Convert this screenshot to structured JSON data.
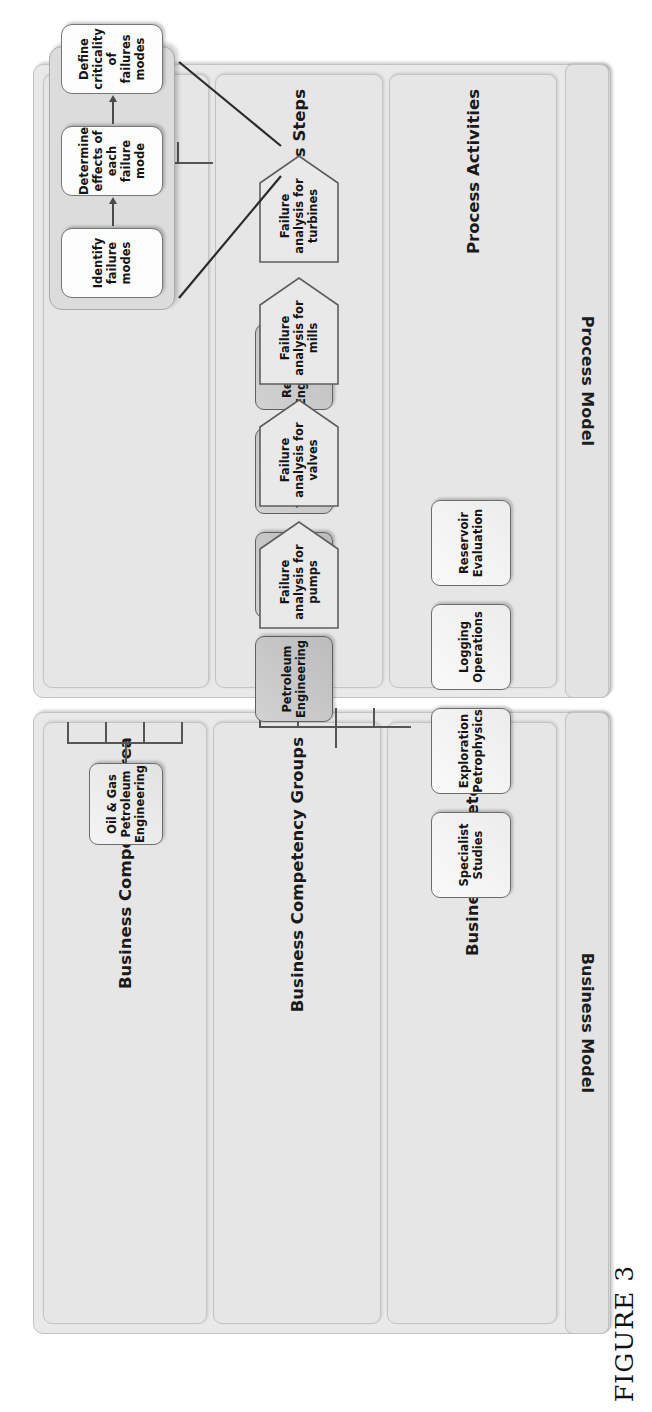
{
  "figure": {
    "caption": "FIGURE 3"
  },
  "sections": [
    {
      "id": "business-model",
      "title": "Business Model",
      "lanes": [
        {
          "id": "business-competency-area",
          "label": "Business Competency Area"
        },
        {
          "id": "business-competency-groups",
          "label": "Business Competency Groups"
        },
        {
          "id": "business-competencies",
          "label": "Business Competencies"
        }
      ]
    },
    {
      "id": "process-model",
      "title": "Process Model",
      "lanes": [
        {
          "id": "business-process",
          "label": "Business Process"
        },
        {
          "id": "process-steps",
          "label": "Process Steps"
        },
        {
          "id": "process-activities",
          "label": "Process Activities"
        }
      ]
    }
  ],
  "nodes": {
    "competency_area": [
      {
        "id": "oil-gas-petroleum-engineering",
        "label": "Oil & Gas Petroleum Engineering"
      }
    ],
    "competency_groups": [
      {
        "id": "petroleum-engineering",
        "label": "Petroleum Engineering"
      },
      {
        "id": "petrophysics",
        "label": "Petrophysics"
      },
      {
        "id": "production-technology",
        "label": "Production Technology"
      },
      {
        "id": "reservoir-engineering",
        "label": "Reservoir Engineering"
      }
    ],
    "competencies": [
      {
        "id": "specialist-studies",
        "label": "Specialist Studies"
      },
      {
        "id": "exploration-petrophysics",
        "label": "Exploration Petrophysics"
      },
      {
        "id": "logging-operations",
        "label": "Logging Operations"
      },
      {
        "id": "reservoir-evaluation",
        "label": "Reservoir Evaluation"
      }
    ],
    "business_process": [
      {
        "id": "technical-quality-control",
        "label": "Technical quality control"
      }
    ],
    "process_steps": [
      {
        "id": "failure-analysis-for-pumps",
        "label": "Failure analysis for pumps"
      },
      {
        "id": "failure-analysis-for-valves",
        "label": "Failure analysis for valves"
      },
      {
        "id": "failure-analysis-for-mills",
        "label": "Failure analysis for mills"
      },
      {
        "id": "failure-analysis-for-turbines",
        "label": "Failure analysis for turbines"
      }
    ],
    "process_activities": [
      {
        "id": "identify-failure-modes",
        "label": "Identify failure modes"
      },
      {
        "id": "determine-effects-of-each-failure-mode",
        "label": "Determine effects of each failure mode"
      },
      {
        "id": "define-criticality-of-failures-modes",
        "label": "Define criticality of failures modes"
      }
    ]
  },
  "colors": {
    "page_background": "#ffffff",
    "section_fill": "#e9e9e9",
    "lane_fill": "#e6e6e6",
    "node_fill_light": "#f4f4f4",
    "node_fill_dark": "#c8c8c8",
    "node_fill_white": "#fdfdfd",
    "activity_container_fill": "#dcdcdc",
    "border": "#6d6d6d",
    "connector": "#555555",
    "text": "#151515"
  }
}
